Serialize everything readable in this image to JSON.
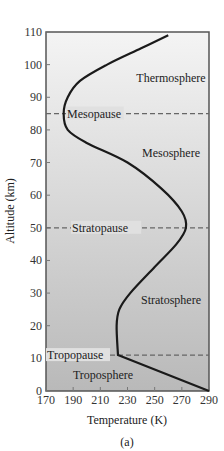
{
  "chart_data": {
    "type": "line",
    "title": "",
    "xlabel": "Temperature (K)",
    "ylabel": "Altitude (km)",
    "xlim": [
      170,
      290
    ],
    "ylim": [
      0,
      110
    ],
    "xticks": [
      170,
      190,
      210,
      230,
      250,
      270,
      290
    ],
    "yticks": [
      0,
      10,
      20,
      30,
      40,
      50,
      60,
      70,
      80,
      90,
      100,
      110
    ],
    "grid": false,
    "series": [
      {
        "name": "Temperature profile",
        "x": [
          290,
          223,
          222,
          224,
          232,
          250,
          266,
          273,
          270,
          255,
          230,
          200,
          186,
          183,
          186,
          195,
          215,
          240,
          260
        ],
        "y": [
          0,
          11,
          20,
          25,
          30,
          38,
          45,
          50,
          55,
          62,
          70,
          76,
          80,
          85,
          90,
          95,
          100,
          105,
          109
        ]
      }
    ],
    "boundaries": [
      {
        "name": "Tropopause",
        "altitude": 11
      },
      {
        "name": "Stratopause",
        "altitude": 50
      },
      {
        "name": "Mesopause",
        "altitude": 85
      }
    ],
    "regions": [
      {
        "name": "Troposphere",
        "x": 212,
        "y": 5
      },
      {
        "name": "Stratosphere",
        "x": 262,
        "y": 28
      },
      {
        "name": "Mesosphere",
        "x": 262,
        "y": 73
      },
      {
        "name": "Thermosphere",
        "x": 262,
        "y": 96
      }
    ],
    "caption": "(a)"
  }
}
